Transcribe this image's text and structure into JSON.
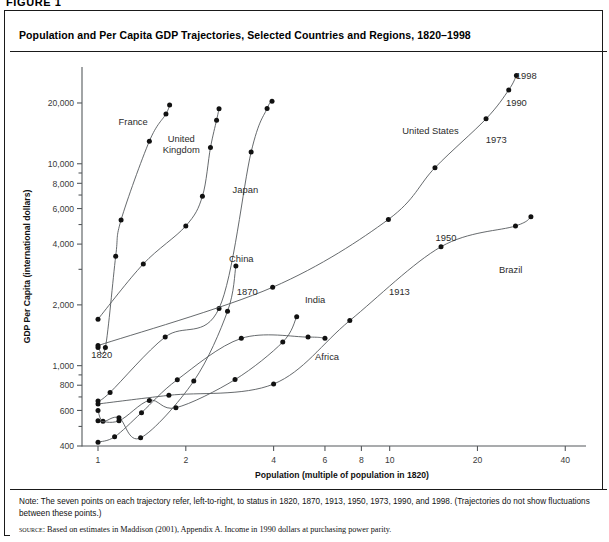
{
  "figure_tag": "FIGURE 1",
  "title": "Population and Per Capita GDP Trajectories, Selected Countries and Regions, 1820–1998",
  "notes": {
    "note": "Note: The seven points on each trajectory refer, left-to-right, to status in 1820, 1870, 1913, 1950, 1973, 1990, and 1998. (Trajectories do not show fluctuations between these points.)",
    "source_kicker": "source:",
    "source_text": "Based on estimates in Maddison (2001), Appendix A. Income in 1990 dollars at purchasing power parity."
  },
  "colors": {
    "line": "#55595c",
    "point": "#111111",
    "frame": "#1a1a1a",
    "text": "#2b2b2b"
  },
  "chart_data": {
    "type": "line",
    "title": "Population and Per Capita GDP Trajectories, Selected Countries and Regions, 1820–1998",
    "xlabel": "Population (multiple of population in 1820)",
    "ylabel": "GDP Per Capita (international dollars)",
    "xscale": "log",
    "yscale": "log",
    "xlim": [
      0.85,
      44
    ],
    "ylim": [
      380,
      26000
    ],
    "xticks": [
      1,
      2,
      4,
      6,
      8,
      10,
      20,
      40
    ],
    "xticklabels": [
      "1",
      "2",
      "4",
      "6",
      "8",
      "10",
      "20",
      "40"
    ],
    "yticks": [
      400,
      600,
      800,
      1000,
      2000,
      4000,
      6000,
      8000,
      10000,
      20000
    ],
    "yticklabels": [
      "400",
      "600",
      "800",
      "1,000",
      "2,000",
      "4,000",
      "6,000",
      "8,000",
      "10,000",
      "20,000"
    ],
    "grid": false,
    "legend": "inline-labels",
    "years": [
      1820,
      1870,
      1913,
      1950,
      1973,
      1990,
      1998
    ],
    "point_year_labels": [
      "1820",
      "1870",
      "1913",
      "1950",
      "1973",
      "1990",
      "1998"
    ],
    "series": [
      {
        "name": "France",
        "label": "France",
        "label_xy": [
          1.32,
          15500
        ],
        "x": [
          1.0,
          1.06,
          1.15,
          1.2,
          1.5,
          1.71,
          1.76
        ],
        "y": [
          1230,
          1230,
          3485,
          5270,
          12940,
          17650,
          19560
        ]
      },
      {
        "name": "United Kingdom",
        "label": "United\nKingdom",
        "label_xy": [
          1.93,
          12800
        ],
        "x": [
          1.0,
          1.43,
          2.0,
          2.28,
          2.43,
          2.55,
          2.6
        ],
        "y": [
          1700,
          3190,
          4920,
          6900,
          12020,
          16430,
          18700
        ]
      },
      {
        "name": "Japan",
        "label": "Japan",
        "label_xy": [
          3.2,
          7200
        ],
        "x": [
          1.0,
          1.1,
          1.7,
          2.6,
          3.35,
          3.8,
          3.95
        ],
        "y": [
          669,
          737,
          1387,
          1921,
          11434,
          18789,
          20410
        ]
      },
      {
        "name": "China",
        "label": "China",
        "label_xy": [
          3.1,
          3250
        ],
        "x": [
          1.0,
          1.04,
          1.18,
          1.4,
          2.13,
          2.78,
          2.97
        ],
        "y": [
          600,
          530,
          552,
          439,
          839,
          1858,
          3117
        ]
      },
      {
        "name": "India",
        "label": "India",
        "label_xy": [
          5.55,
          2050
        ],
        "x": [
          1.0,
          1.18,
          1.5,
          1.85,
          2.95,
          4.3,
          4.8
        ],
        "y": [
          533,
          533,
          673,
          619,
          853,
          1309,
          1746
        ]
      },
      {
        "name": "Africa",
        "label": "Africa",
        "label_xy": [
          6.1,
          1070
        ],
        "x": [
          1.0,
          1.14,
          1.41,
          1.87,
          3.1,
          5.25,
          6.0
        ],
        "y": [
          418,
          444,
          585,
          852,
          1365,
          1385,
          1368
        ]
      },
      {
        "name": "Brazil",
        "label": "Brazil",
        "label_xy": [
          26.0,
          2870
        ],
        "x": [
          1.0,
          1.75,
          4.0,
          7.3,
          15.0,
          27.0,
          30.5
        ],
        "y": [
          646,
          713,
          811,
          1672,
          3882,
          4920,
          5459
        ]
      },
      {
        "name": "United States",
        "label": "United States",
        "label_xy": [
          13.8,
          14000
        ],
        "x": [
          1.0,
          3.97,
          9.9,
          14.3,
          21.4,
          25.6,
          27.2
        ],
        "y": [
          1257,
          2445,
          5301,
          9561,
          16689,
          23200,
          27331
        ]
      }
    ],
    "annotations": [
      {
        "text": "1820",
        "xy": [
          1.03,
          1090
        ],
        "series": "France"
      },
      {
        "text": "1870",
        "xy": [
          3.25,
          2230
        ],
        "series": "United States"
      },
      {
        "text": "1913",
        "xy": [
          10.8,
          2250
        ],
        "series": "United States"
      },
      {
        "text": "1950",
        "xy": [
          15.6,
          4150
        ],
        "series": "United States"
      },
      {
        "text": "1973",
        "xy": [
          23.2,
          12600
        ],
        "series": "United States"
      },
      {
        "text": "1990",
        "xy": [
          27.2,
          19300
        ],
        "series": "United States"
      },
      {
        "text": "1998",
        "xy": [
          29.4,
          26400
        ],
        "series": "United States"
      }
    ]
  }
}
